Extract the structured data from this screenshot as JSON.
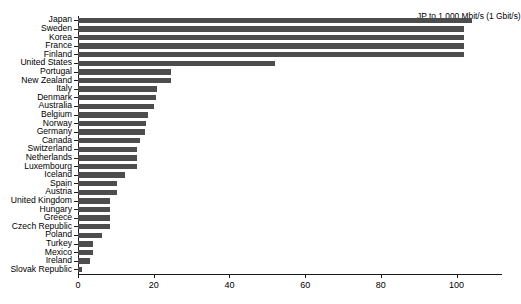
{
  "chart_data": {
    "type": "bar",
    "orientation": "horizontal",
    "title": "",
    "subtitle": "",
    "xlabel": "",
    "ylabel": "",
    "xlim": [
      0,
      112
    ],
    "xticks": [
      0,
      20,
      40,
      60,
      80,
      100
    ],
    "grid": false,
    "legend": null,
    "bar_color": "#4d4d4d",
    "axis_color": "#1a1a1a",
    "annotations": [
      {
        "text": "JP  to 1,000 Mbit/s (1 Gbit/s)",
        "x_px": 417,
        "y_px": 11
      }
    ],
    "categories": [
      "Japan",
      "Sweden",
      "Korea",
      "France",
      "Finland",
      "United States",
      "Portugal",
      "New Zealand",
      "Italy",
      "Denmark",
      "Australia",
      "Belgium",
      "Norway",
      "Germany",
      "Canada",
      "Switzerland",
      "Netherlands",
      "Luxembourg",
      "Iceland",
      "Spain",
      "Austria",
      "United Kingdom",
      "Hungary",
      "Greece",
      "Czech Republic",
      "Poland",
      "Turkey",
      "Mexico",
      "Ireland",
      "Slovak Republic"
    ],
    "values": [
      104.0,
      102.0,
      102.0,
      102.0,
      102.0,
      52.0,
      24.5,
      24.5,
      20.8,
      20.5,
      20.2,
      18.5,
      18.0,
      17.8,
      16.5,
      15.5,
      15.5,
      15.5,
      12.5,
      10.2,
      10.2,
      8.4,
      8.4,
      8.4,
      8.4,
      6.3,
      4.0,
      4.0,
      3.1,
      1.1
    ]
  }
}
